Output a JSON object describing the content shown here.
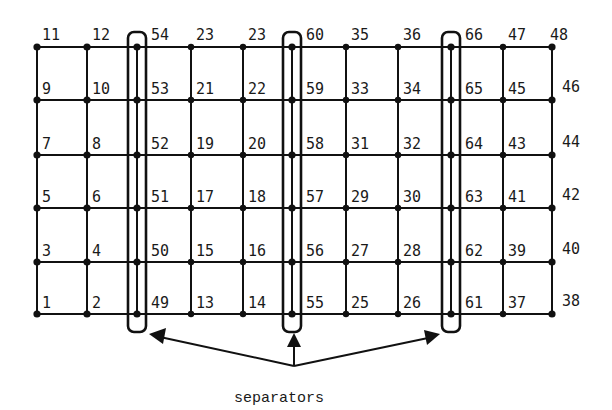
{
  "diagram": {
    "type": "grid-graph-with-separators",
    "columns_x": [
      37,
      87,
      137,
      191,
      243,
      292,
      346,
      398,
      451,
      503,
      552
    ],
    "rows_y": [
      47,
      100,
      155,
      208,
      262,
      314
    ],
    "separator_columns": [
      2,
      5,
      8
    ],
    "colors": {
      "ink": "#111111",
      "background": "#ffffff"
    },
    "labels": [
      [
        "11",
        "12",
        "54",
        "23",
        "23",
        "60",
        "35",
        "36",
        "66",
        "47",
        "48"
      ],
      [
        "9",
        "10",
        "53",
        "21",
        "22",
        "59",
        "33",
        "34",
        "65",
        "45",
        "46"
      ],
      [
        "7",
        "8",
        "52",
        "19",
        "20",
        "58",
        "31",
        "32",
        "64",
        "43",
        "44"
      ],
      [
        "5",
        "6",
        "51",
        "17",
        "18",
        "57",
        "29",
        "30",
        "63",
        "41",
        "42"
      ],
      [
        "3",
        "4",
        "50",
        "15",
        "16",
        "56",
        "27",
        "28",
        "62",
        "39",
        "40"
      ],
      [
        "1",
        "2",
        "49",
        "13",
        "14",
        "55",
        "25",
        "26",
        "61",
        "37",
        "38"
      ]
    ],
    "caption": "separators"
  }
}
